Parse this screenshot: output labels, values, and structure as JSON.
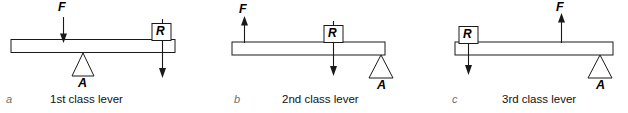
{
  "figure": {
    "title": "Classes of levers",
    "width": 628,
    "height": 113,
    "background": "#ffffff",
    "stroke_color": "#1a1a1a",
    "beam_fill": "#ffffff",
    "letter_color": "#6e6e6e"
  },
  "panels": [
    {
      "letter": "a",
      "caption": "1st class lever",
      "force_label": "F",
      "force_direction": "down",
      "load_label": "R",
      "load_direction": "down",
      "fulcrum_label": "A",
      "fulcrum_position": "center",
      "order": "F-left, A-center, R-right"
    },
    {
      "letter": "b",
      "caption": "2nd class lever",
      "force_label": "F",
      "force_direction": "up",
      "load_label": "R",
      "load_direction": "down",
      "fulcrum_label": "A",
      "fulcrum_position": "right",
      "order": "F-left, R-center, A-right"
    },
    {
      "letter": "c",
      "caption": "3rd class lever",
      "force_label": "F",
      "force_direction": "up",
      "load_label": "R",
      "load_direction": "down",
      "fulcrum_label": "A",
      "fulcrum_position": "right",
      "order": "R-left, F-center, A-right"
    }
  ]
}
